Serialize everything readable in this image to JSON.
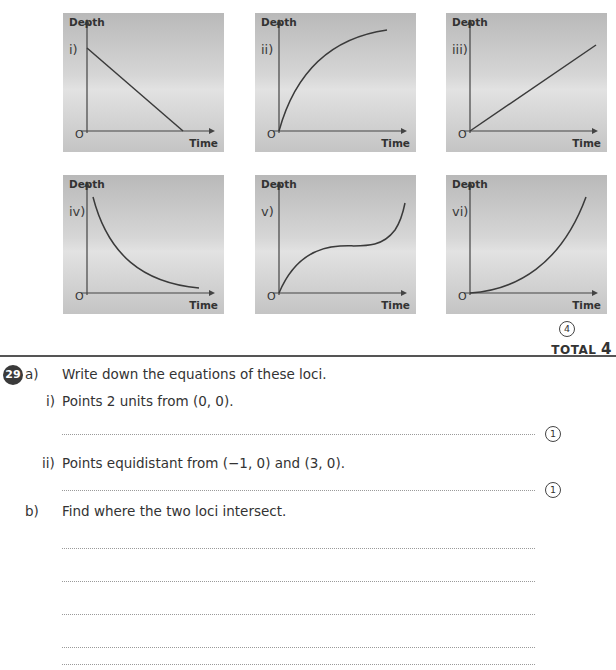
{
  "graphs": [
    {
      "id": "i",
      "label": "i)",
      "ylabel": "Depth",
      "xlabel": "Time",
      "origin": "O",
      "shape": "linear-decreasing"
    },
    {
      "id": "ii",
      "label": "ii)",
      "ylabel": "Depth",
      "xlabel": "Time",
      "origin": "O",
      "shape": "concave-increasing"
    },
    {
      "id": "iii",
      "label": "iii)",
      "ylabel": "Depth",
      "xlabel": "Time",
      "origin": "O",
      "shape": "linear-increasing"
    },
    {
      "id": "iv",
      "label": "iv)",
      "ylabel": "Depth",
      "xlabel": "Time",
      "origin": "O",
      "shape": "convex-decreasing"
    },
    {
      "id": "v",
      "label": "v)",
      "ylabel": "Depth",
      "xlabel": "Time",
      "origin": "O",
      "shape": "cubic-increasing"
    },
    {
      "id": "vi",
      "label": "vi)",
      "ylabel": "Depth",
      "xlabel": "Time",
      "origin": "O",
      "shape": "convex-increasing"
    }
  ],
  "q28": {
    "marks": "4",
    "total_label": "TOTAL",
    "total_value": "4"
  },
  "q29": {
    "number": "29",
    "part_a": {
      "label": "a)",
      "text": "Write down the equations of these loci.",
      "items": [
        {
          "label": "i)",
          "text": "Points 2 units from (0, 0).",
          "marks": "1"
        },
        {
          "label": "ii)",
          "text": "Points equidistant from (−1, 0) and (3, 0).",
          "marks": "1"
        }
      ]
    },
    "part_b": {
      "label": "b)",
      "text": "Find where the two loci intersect.",
      "answer_lines": 5
    }
  }
}
